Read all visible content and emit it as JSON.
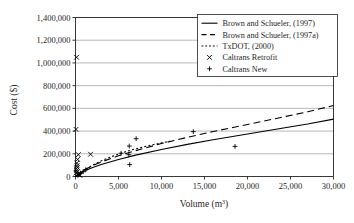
{
  "chart_data": {
    "type": "scatter",
    "title": "",
    "xlabel": "Volume (m3)",
    "xlabel_base": "Volume (m",
    "xlabel_sup": "3",
    "xlabel_tail": ")",
    "ylabel": "Cost ($)",
    "xlim": [
      0,
      30000
    ],
    "ylim": [
      0,
      1400000
    ],
    "grid": "horizontal",
    "legend_position": "top-right",
    "xticks": [
      0,
      5000,
      10000,
      15000,
      20000,
      25000,
      30000
    ],
    "xtick_labels": [
      "0",
      "5,000",
      "10,000",
      "15,000",
      "20,000",
      "25,000",
      "30,000"
    ],
    "yticks": [
      0,
      200000,
      400000,
      600000,
      800000,
      1000000,
      1200000,
      1400000
    ],
    "ytick_labels": [
      "0",
      "200,000",
      "400,000",
      "600,000",
      "800,000",
      "1,000,000",
      "1,200,000",
      "1,400,000"
    ],
    "series": [
      {
        "name": "Brown and Schueler, (1997)",
        "type": "line",
        "style": "solid",
        "color": "#000000",
        "x": [
          0,
          1000,
          2000,
          3000,
          5000,
          7000,
          10000,
          13000,
          16000,
          20000,
          24000,
          27000,
          30000
        ],
        "y": [
          0,
          48000,
          79000,
          106000,
          150000,
          188000,
          238000,
          283000,
          324000,
          374000,
          425000,
          462000,
          505000
        ]
      },
      {
        "name": "Brown and Schueler, (1997a)",
        "type": "line",
        "style": "dashed",
        "color": "#000000",
        "x": [
          0,
          1000,
          2000,
          3000,
          5000,
          7000,
          10000,
          13000,
          16000,
          20000,
          24000,
          27000,
          30000
        ],
        "y": [
          0,
          58000,
          96000,
          128000,
          182000,
          228000,
          290000,
          345000,
          396000,
          458000,
          522000,
          570000,
          625000
        ]
      },
      {
        "name": "TxDOT, (2000)",
        "type": "line",
        "style": "dotted",
        "color": "#000000",
        "x": [
          0,
          500,
          1000,
          2000,
          3000,
          4000,
          5000,
          6000,
          7000,
          8000,
          9000,
          10000,
          11000
        ],
        "y": [
          0,
          30000,
          55000,
          100000,
          138000,
          170000,
          198000,
          222000,
          244000,
          263000,
          280000,
          296000,
          310000
        ]
      },
      {
        "name": "Caltrans Retrofit",
        "type": "scatter",
        "marker": "x",
        "color": "#000000",
        "points": [
          [
            120,
            1050000
          ],
          [
            60,
            415000
          ],
          [
            1750,
            196000
          ],
          [
            330,
            192000
          ],
          [
            250,
            150000
          ],
          [
            150,
            118000
          ],
          [
            180,
            96000
          ],
          [
            210,
            80000
          ],
          [
            90,
            68000
          ],
          [
            130,
            52000
          ],
          [
            200,
            40000
          ],
          [
            60,
            30000
          ],
          [
            300,
            22000
          ],
          [
            420,
            16000
          ],
          [
            520,
            10000
          ]
        ]
      },
      {
        "name": "Caltrans New",
        "type": "scatter",
        "marker": "+",
        "color": "#000000",
        "points": [
          [
            7050,
            333000
          ],
          [
            6250,
            268000
          ],
          [
            5300,
            205000
          ],
          [
            6200,
            192000
          ],
          [
            13700,
            395000
          ],
          [
            18550,
            265000
          ],
          [
            6300,
            105000
          ],
          [
            1200,
            60000
          ],
          [
            900,
            42000
          ],
          [
            600,
            30000
          ],
          [
            400,
            20000
          ]
        ]
      }
    ],
    "legend": [
      {
        "label": "Brown and Schueler, (1997)",
        "marker": "solid-line"
      },
      {
        "label": "Brown and Schueler, (1997a)",
        "marker": "dashed-line"
      },
      {
        "label": "TxDOT, (2000)",
        "marker": "dotted-line"
      },
      {
        "label": "Caltrans Retrofit",
        "marker": "x"
      },
      {
        "label": "Caltrans New",
        "marker": "plus"
      }
    ]
  }
}
